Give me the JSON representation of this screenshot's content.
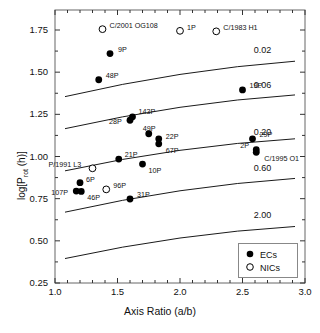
{
  "chart_data": {
    "type": "scatter",
    "title": "",
    "xlabel": "Axis Ratio (a/b)",
    "ylabel": "log[P_rot (h)]",
    "ylabel_display": "log[P",
    "ylabel_sub": "rot",
    "ylabel_tail": " (h)]",
    "xlim": [
      1.0,
      3.0
    ],
    "ylim": [
      0.25,
      1.75
    ],
    "xticks": [
      1.0,
      1.5,
      2.0,
      2.5,
      3.0
    ],
    "xticklabels": [
      "1.0",
      "1.5",
      "2.0",
      "2.5",
      "3.0"
    ],
    "yticks": [
      0.25,
      0.5,
      0.75,
      1.0,
      1.25,
      1.5,
      1.75
    ],
    "yticklabels": [
      "0.25",
      "0.50",
      "0.75",
      "1.00",
      "1.25",
      "1.50",
      "1.75"
    ],
    "grid": false,
    "minor_ticks": true,
    "legend_position": "lower-right",
    "series": [
      {
        "name": "ECs",
        "marker": "filled-circle",
        "points": [
          {
            "label": "9P",
            "x": 1.44,
            "y": 1.61,
            "lx": 8,
            "ly": -8
          },
          {
            "label": "48P",
            "x": 1.35,
            "y": 1.455,
            "lx": 7,
            "ly": -8
          },
          {
            "label": "143P",
            "x": 1.62,
            "y": 1.235,
            "lx": 6,
            "ly": -9
          },
          {
            "label": "28P",
            "x": 1.6,
            "y": 1.215,
            "lx": -21,
            "ly": -2
          },
          {
            "label": "49P",
            "x": 1.75,
            "y": 1.135,
            "lx": -6,
            "ly": -9
          },
          {
            "label": "22P",
            "x": 1.83,
            "y": 1.105,
            "lx": 7,
            "ly": -6
          },
          {
            "label": "67P",
            "x": 1.83,
            "y": 1.075,
            "lx": 7,
            "ly": 3
          },
          {
            "label": "21P",
            "x": 1.51,
            "y": 0.985,
            "lx": 6,
            "ly": -8
          },
          {
            "label": "10P",
            "x": 1.7,
            "y": 0.955,
            "lx": 6,
            "ly": 3
          },
          {
            "label": "6P",
            "x": 1.2,
            "y": 0.845,
            "lx": 6,
            "ly": -7
          },
          {
            "label": "107P",
            "x": 1.17,
            "y": 0.795,
            "lx": -25,
            "ly": -2
          },
          {
            "label": "46P",
            "x": 1.21,
            "y": 0.793,
            "lx": 6,
            "ly": 3
          },
          {
            "label": "31P",
            "x": 1.6,
            "y": 0.748,
            "lx": 7,
            "ly": -8
          },
          {
            "label": "19P",
            "x": 2.5,
            "y": 1.395,
            "lx": 7,
            "ly": -8
          },
          {
            "label": "29P",
            "x": 2.58,
            "y": 1.105,
            "lx": 7,
            "ly": -8
          },
          {
            "label": "2P",
            "x": 2.61,
            "y": 1.04,
            "lx": -16,
            "ly": -8
          },
          {
            "label": "C/1995 O1",
            "x": 2.61,
            "y": 1.025,
            "lx": 8,
            "ly": 3
          }
        ]
      },
      {
        "name": "NICs",
        "marker": "open-circle",
        "points": [
          {
            "label": "C/2001 OG108",
            "x": 1.38,
            "y": 1.755,
            "lx": 7,
            "ly": -7
          },
          {
            "label": "1P",
            "x": 2.0,
            "y": 1.745,
            "lx": 7,
            "ly": -7
          },
          {
            "label": "C/1983 H1",
            "x": 2.29,
            "y": 1.742,
            "lx": 7,
            "ly": -7
          },
          {
            "label": "P/1991 L3",
            "x": 1.3,
            "y": 0.93,
            "lx": -44,
            "ly": -7
          },
          {
            "label": "96P",
            "x": 1.41,
            "y": 0.805,
            "lx": 7,
            "ly": -7
          }
        ]
      }
    ],
    "curves": [
      {
        "label": "0.02",
        "x0": 1.08,
        "y0": 1.355,
        "x1": 2.92,
        "y1": 1.565,
        "lx": 2.59,
        "ly": 1.625
      },
      {
        "label": "0.06",
        "x0": 1.08,
        "y0": 1.165,
        "x1": 2.92,
        "y1": 1.365,
        "lx": 2.59,
        "ly": 1.42
      },
      {
        "label": "0.20",
        "x0": 1.08,
        "y0": 0.915,
        "x1": 2.92,
        "y1": 1.105,
        "lx": 2.59,
        "ly": 1.14
      },
      {
        "label": "0.60",
        "x0": 1.08,
        "y0": 0.67,
        "x1": 2.92,
        "y1": 0.87,
        "lx": 2.59,
        "ly": 0.925
      },
      {
        "label": "2.00",
        "x0": 1.08,
        "y0": 0.395,
        "x1": 2.92,
        "y1": 0.585,
        "lx": 2.59,
        "ly": 0.65
      }
    ],
    "legend": [
      {
        "symbol": "filled-circle",
        "label": "ECs"
      },
      {
        "symbol": "open-circle",
        "label": "NICs"
      }
    ],
    "colors": {
      "line": "#000000",
      "marker": "#000000",
      "text": "#111111",
      "background": "#ffffff",
      "axis": "#555555"
    }
  }
}
